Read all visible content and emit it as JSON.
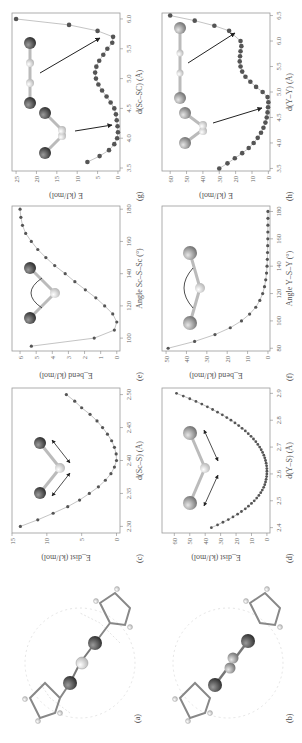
{
  "figure": {
    "panels": [
      {
        "id": "a",
        "label": "(a)",
        "type": "molecule",
        "description": "Sc2S cluster inside fullerene cage, bent Sc-S-Sc"
      },
      {
        "id": "b",
        "label": "(b)",
        "type": "molecule",
        "description": "Y2S cluster inside fullerene cage"
      },
      {
        "id": "c",
        "label": "(c)"
      },
      {
        "id": "d",
        "label": "(d)"
      },
      {
        "id": "e",
        "label": "(e)"
      },
      {
        "id": "f",
        "label": "(f)"
      },
      {
        "id": "g",
        "label": "(g)"
      },
      {
        "id": "h",
        "label": "(h)"
      }
    ]
  },
  "chart_data": [
    {
      "id": "c",
      "label": "(c)",
      "type": "scatter",
      "xlabel": "d(Sc–S) (Å)",
      "ylabel": "E_dist (kJ/mol)",
      "xlim": [
        2.29,
        2.51
      ],
      "ylim": [
        -0.5,
        15
      ],
      "xticks": [
        2.3,
        2.35,
        2.4,
        2.45,
        2.5
      ],
      "yticks": [
        0,
        5,
        10,
        15
      ],
      "x": [
        2.3,
        2.31,
        2.32,
        2.33,
        2.34,
        2.35,
        2.36,
        2.37,
        2.38,
        2.39,
        2.4,
        2.41,
        2.42,
        2.43,
        2.44,
        2.45,
        2.46,
        2.47,
        2.48,
        2.49,
        2.5
      ],
      "y": [
        13.8,
        11.3,
        9.1,
        7.0,
        5.3,
        3.9,
        2.6,
        1.6,
        0.8,
        0.3,
        0.0,
        0.05,
        0.3,
        0.7,
        1.3,
        2.0,
        2.8,
        3.8,
        5.0,
        6.0,
        7.2
      ]
    },
    {
      "id": "d",
      "label": "(d)",
      "type": "scatter",
      "xlabel": "d(Y–S) (Å)",
      "ylabel": "E_dist (kJ/mol)",
      "xlim": [
        2.38,
        2.92
      ],
      "ylim": [
        -2,
        68
      ],
      "xticks": [
        2.4,
        2.5,
        2.6,
        2.7,
        2.8,
        2.9
      ],
      "yticks": [
        0,
        10,
        20,
        30,
        40,
        50,
        60
      ],
      "x_start": 2.4,
      "x_step": 0.01,
      "y": [
        36,
        32,
        28.5,
        25,
        22,
        19,
        16.5,
        14,
        12,
        10,
        8.2,
        6.6,
        5.2,
        4.0,
        3.0,
        2.1,
        1.4,
        0.9,
        0.5,
        0.2,
        0.05,
        0.0,
        0.05,
        0.2,
        0.5,
        0.9,
        1.4,
        2.0,
        2.8,
        3.7,
        4.7,
        5.9,
        7.2,
        8.7,
        10.3,
        12.1,
        14.0,
        16.1,
        18.3,
        20.7,
        23.3,
        26.0,
        28.9,
        32.0,
        35.2,
        38.6,
        42.2,
        46.0,
        50.0,
        54.2,
        58.6
      ]
    },
    {
      "id": "e",
      "label": "(e)",
      "type": "scatter",
      "xlabel": "Angle Sc–S–Sc (°)",
      "ylabel": "E_bend (kJ/mol)",
      "xlim": [
        92,
        182
      ],
      "ylim": [
        -0.2,
        6.5
      ],
      "xticks": [
        100,
        120,
        140,
        160,
        180
      ],
      "yticks": [
        0,
        1,
        2,
        3,
        4,
        5,
        6
      ],
      "x": [
        95,
        100,
        105,
        110,
        115,
        120,
        125,
        130,
        135,
        140,
        145,
        150,
        155,
        160,
        165,
        170,
        175,
        180
      ],
      "y": [
        5.3,
        1.4,
        0.15,
        0.0,
        0.25,
        0.75,
        1.3,
        1.95,
        2.6,
        3.2,
        3.85,
        4.4,
        4.9,
        5.3,
        5.65,
        5.85,
        5.95,
        6.0
      ]
    },
    {
      "id": "f",
      "label": "(f)",
      "type": "scatter",
      "xlabel": "Angle Y–S–Y (°)",
      "ylabel": "E_bend (kJ/mol)",
      "xlim": [
        78,
        184
      ],
      "ylim": [
        -1,
        52
      ],
      "xticks": [
        80,
        100,
        120,
        140,
        160,
        180
      ],
      "yticks": [
        0,
        10,
        20,
        30,
        40,
        50
      ],
      "x": [
        80,
        85,
        90,
        95,
        100,
        105,
        110,
        115,
        120,
        125,
        130,
        135,
        140,
        145,
        150,
        155,
        160,
        165,
        170,
        175,
        180
      ],
      "y": [
        49,
        36,
        26,
        18.5,
        13,
        9,
        6,
        4,
        2.6,
        1.7,
        1.1,
        0.7,
        0.45,
        0.3,
        0.2,
        0.12,
        0.07,
        0.04,
        0.02,
        0.01,
        0.0
      ]
    },
    {
      "id": "g",
      "label": "(g)",
      "type": "line",
      "xlabel": "d(Sc–SC) (Å)",
      "ylabel": "E (kJ/mol)",
      "xlim": [
        3.45,
        6.1
      ],
      "ylim": [
        -0.5,
        26
      ],
      "xticks": [
        3.5,
        4.0,
        4.5,
        5.0,
        5.5,
        6.0
      ],
      "yticks": [
        0,
        5,
        10,
        15,
        20,
        25
      ],
      "x": [
        3.6,
        3.7,
        3.8,
        3.9,
        4.0,
        4.1,
        4.2,
        4.3,
        4.4,
        4.5,
        4.6,
        4.7,
        4.8,
        4.9,
        5.0,
        5.1,
        5.2,
        5.3,
        5.4,
        5.5,
        5.6,
        5.7,
        5.8,
        5.9,
        6.0
      ],
      "y": [
        7.5,
        4.5,
        2.2,
        0.9,
        0.2,
        0.0,
        0.1,
        0.3,
        0.5,
        0.9,
        1.8,
        2.8,
        3.9,
        4.8,
        5.4,
        5.6,
        5.3,
        4.6,
        3.6,
        2.6,
        1.4,
        1.2,
        5.0,
        12.0,
        25.0
      ],
      "annotations": [
        "linear Sc–S–Sc minimum near 5.7 Å",
        "bent minimum near 4.1 Å"
      ]
    },
    {
      "id": "h",
      "label": "(h)",
      "type": "line",
      "xlabel": "d(Y–Y) (Å)",
      "ylabel": "E (kJ/mol)",
      "xlim": [
        3.45,
        6.55
      ],
      "ylim": [
        -1,
        65
      ],
      "xticks": [
        3.5,
        4.0,
        4.5,
        5.0,
        5.5,
        6.0,
        6.5
      ],
      "yticks": [
        0,
        10,
        20,
        30,
        40,
        50,
        60
      ],
      "x": [
        3.5,
        3.6,
        3.7,
        3.8,
        3.9,
        4.0,
        4.1,
        4.2,
        4.3,
        4.4,
        4.5,
        4.6,
        4.7,
        4.8,
        4.9,
        5.0,
        5.1,
        5.2,
        5.3,
        5.4,
        5.5,
        5.6,
        5.7,
        5.8,
        5.9,
        6.0,
        6.2,
        6.3,
        6.4,
        6.5
      ],
      "y": [
        30,
        25,
        20.5,
        16,
        12,
        9,
        6.5,
        4.5,
        3.0,
        1.8,
        1.0,
        0.5,
        0.2,
        0.0,
        0.5,
        3.5,
        7.5,
        11,
        14,
        16,
        17,
        17.5,
        17.3,
        17,
        16.5,
        17,
        24,
        33,
        45,
        60
      ],
      "annotations": [
        "linear minimum near 6.0 Å",
        "bent minimum near 4.8 Å"
      ]
    }
  ]
}
